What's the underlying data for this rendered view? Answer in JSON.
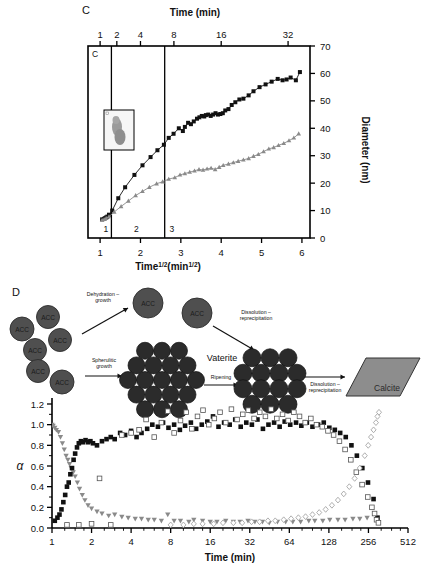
{
  "figure": {
    "panels": [
      {
        "letter": "C"
      },
      {
        "letter": "D"
      }
    ]
  },
  "panelC": {
    "letter": "C",
    "inner_letter": "C",
    "top_axis_title": "Time (min)",
    "top_tick_labels": [
      "1",
      "2",
      "4",
      "8",
      "16",
      "32"
    ],
    "bottom_axis_title_main": "Time",
    "bottom_axis_title_sup1": "1/2",
    "bottom_axis_title_mid": "(min",
    "bottom_axis_title_sup2": "1/2",
    "bottom_axis_title_end": ")",
    "bottom_tick_labels": [
      "1",
      "2",
      "3",
      "4",
      "5",
      "6"
    ],
    "y_axis_title": "Diameter (nm)",
    "y_tick_labels": [
      "0",
      "10",
      "20",
      "30",
      "40",
      "50",
      "60",
      "70"
    ],
    "region_labels": [
      "1",
      "2",
      "3"
    ],
    "inset_name": "tem-particle-inset"
  },
  "panelD": {
    "letter": "D",
    "schematic": {
      "acc_label": "ACC",
      "acc_count": 8,
      "arrow_labels": [
        {
          "line1": "Dehydration –",
          "line2": "growth"
        },
        {
          "line1": "Spherulitic",
          "line2": "growth"
        },
        {
          "line1": "Dissolution –",
          "line2": "reprecipitation"
        },
        {
          "line1": "Ripening",
          "line2": ""
        },
        {
          "line1": "Dissolution –",
          "line2": "reprecipitation"
        }
      ],
      "vaterite_label": "Vaterite",
      "calcite_label": "Calcite"
    },
    "y_axis_title": "α",
    "y_tick_labels": [
      "0.0",
      "0.2",
      "0.4",
      "0.6",
      "0.8",
      "1.0",
      "1.2"
    ],
    "x_axis_title": "Time (min)",
    "x_tick_labels": [
      "1",
      "2",
      "4",
      "8",
      "16",
      "32",
      "64",
      "128",
      "256",
      "512"
    ]
  },
  "colors": {
    "black": "#111111",
    "gray_marker": "#8a8a8a",
    "gray_dark": "#4a4a4a",
    "acc_fill": "#4f4f4f",
    "sphere_fill": "#2b2b2b",
    "calcite_fill": "#8d8d8d",
    "axis": "#000000"
  },
  "chart_data": [
    {
      "type": "scatter",
      "panel": "C",
      "title": "",
      "xlabel": "Time^1/2 (min^1/2)",
      "ylabel": "Diameter (nm)",
      "xlim": [
        0.7,
        6.2
      ],
      "ylim": [
        0,
        70
      ],
      "xticks": [
        1,
        2,
        3,
        4,
        5,
        6
      ],
      "yticks": [
        0,
        10,
        20,
        30,
        40,
        50,
        60,
        70
      ],
      "top_axis": {
        "label": "Time (min)",
        "ticks": [
          1,
          2,
          4,
          8,
          16,
          32
        ]
      },
      "region_dividers_x": [
        1.28,
        2.6
      ],
      "regions": [
        "1",
        "2",
        "3"
      ],
      "grid": false,
      "legend": "none",
      "series": [
        {
          "name": "black-squares-diameter",
          "marker": "filled-square",
          "color": "#111111",
          "x": [
            1.05,
            1.1,
            1.12,
            1.15,
            1.18,
            1.22,
            1.3,
            1.45,
            1.62,
            1.85,
            2.05,
            2.25,
            2.42,
            2.58,
            2.7,
            2.82,
            2.95,
            3.05,
            3.1,
            3.18,
            3.25,
            3.32,
            3.4,
            3.46,
            3.52,
            3.58,
            3.62,
            3.68,
            3.74,
            3.8,
            3.86,
            3.92,
            3.98,
            4.04,
            4.1,
            4.18,
            4.26,
            4.35,
            4.45,
            4.55,
            4.68,
            4.8,
            4.95,
            5.1,
            5.25,
            5.4,
            5.52,
            5.62,
            5.72,
            5.85,
            5.95
          ],
          "y": [
            6.8,
            7.0,
            7.2,
            7.5,
            7.8,
            8.5,
            10.0,
            14.5,
            18.5,
            23.0,
            26.5,
            29.5,
            32.0,
            34.0,
            36.5,
            38.0,
            40.0,
            39.0,
            40.5,
            42.0,
            41.5,
            42.5,
            43.5,
            44.0,
            44.5,
            44.3,
            44.8,
            45.0,
            44.5,
            45.0,
            45.5,
            45.0,
            45.2,
            45.5,
            46.5,
            47.0,
            48.5,
            49.5,
            50.5,
            50.8,
            52.0,
            53.5,
            55.0,
            56.0,
            57.0,
            58.0,
            57.5,
            57.8,
            58.5,
            57.5,
            60.5
          ]
        },
        {
          "name": "gray-triangles-diameter",
          "marker": "filled-triangle-up",
          "color": "#8a8a8a",
          "x": [
            1.05,
            1.1,
            1.15,
            1.22,
            1.35,
            1.52,
            1.7,
            1.88,
            2.05,
            2.22,
            2.4,
            2.55,
            2.7,
            2.85,
            2.98,
            3.1,
            3.22,
            3.34,
            3.45,
            3.55,
            3.65,
            3.75,
            3.85,
            3.95,
            4.05,
            4.18,
            4.3,
            4.42,
            4.55,
            4.68,
            4.8,
            4.92,
            5.05,
            5.18,
            5.3,
            5.42,
            5.55,
            5.68,
            5.8,
            5.92
          ],
          "y": [
            6.5,
            6.8,
            7.2,
            7.8,
            9.5,
            11.5,
            13.5,
            15.5,
            17.0,
            18.5,
            19.8,
            20.5,
            21.5,
            22.0,
            23.0,
            23.5,
            24.0,
            24.5,
            25.0,
            24.8,
            25.2,
            25.5,
            25.0,
            25.8,
            26.5,
            27.0,
            27.5,
            28.0,
            28.5,
            29.0,
            29.8,
            30.5,
            31.5,
            32.5,
            33.0,
            33.8,
            34.5,
            35.5,
            36.5,
            38.0
          ]
        }
      ]
    },
    {
      "type": "scatter",
      "panel": "D",
      "title": "",
      "xlabel": "Time (min)",
      "ylabel": "α",
      "xscale": "log2",
      "xlim": [
        1,
        512
      ],
      "ylim": [
        0.0,
        1.2
      ],
      "xticks": [
        1,
        2,
        4,
        8,
        16,
        32,
        64,
        128,
        256,
        512
      ],
      "yticks": [
        0.0,
        0.2,
        0.4,
        0.6,
        0.8,
        1.0,
        1.2
      ],
      "grid": false,
      "legend": "none",
      "series": [
        {
          "name": "acc-gray-down-triangles",
          "marker": "filled-triangle-down",
          "color": "#8a8a8a",
          "x": [
            1.0,
            1.02,
            1.05,
            1.08,
            1.12,
            1.16,
            1.2,
            1.24,
            1.28,
            1.32,
            1.36,
            1.4,
            1.45,
            1.5,
            1.56,
            1.62,
            1.7,
            1.78,
            1.88,
            2.0,
            2.2,
            2.4,
            2.7,
            3.0,
            3.4,
            3.8,
            4.3,
            4.8,
            5.4,
            6.0,
            6.8,
            7.6,
            8.5,
            9.5,
            11,
            12,
            14,
            16,
            18,
            21,
            24,
            27,
            31,
            35,
            40,
            45,
            52,
            60,
            68,
            78,
            90,
            100,
            115,
            130,
            150,
            170,
            195,
            220,
            250
          ],
          "y": [
            1.0,
            0.99,
            0.97,
            0.95,
            0.93,
            0.88,
            0.82,
            0.76,
            0.7,
            0.66,
            0.62,
            0.58,
            0.54,
            0.5,
            0.44,
            0.38,
            0.32,
            0.27,
            0.22,
            0.19,
            0.16,
            0.14,
            0.12,
            0.13,
            0.11,
            0.1,
            0.09,
            0.09,
            0.08,
            0.08,
            0.07,
            0.13,
            0.07,
            0.07,
            0.06,
            0.08,
            0.07,
            0.06,
            0.06,
            0.07,
            0.06,
            0.06,
            0.07,
            0.06,
            0.06,
            0.05,
            0.06,
            0.06,
            0.06,
            0.06,
            0.07,
            0.07,
            0.07,
            0.08,
            0.08,
            0.08,
            0.09,
            0.09,
            0.1
          ]
        },
        {
          "name": "vaterite-filled-squares",
          "marker": "filled-square",
          "color": "#111111",
          "x": [
            1.05,
            1.1,
            1.14,
            1.18,
            1.22,
            1.26,
            1.3,
            1.34,
            1.38,
            1.42,
            1.46,
            1.5,
            1.55,
            1.6,
            1.66,
            1.72,
            1.8,
            1.88,
            1.96,
            2.05,
            2.2,
            2.4,
            2.6,
            2.8,
            3.0,
            3.3,
            3.6,
            4.0,
            4.4,
            4.8,
            5.3,
            5.8,
            6.4,
            7.0,
            7.7,
            8.5,
            9.4,
            10.3,
            11.4,
            12.5,
            13.8,
            15.2,
            16.8,
            18.5,
            20.4,
            22.5,
            24.8,
            27.3,
            30.1,
            33.2,
            36.6,
            40.3,
            44.4,
            49,
            54,
            59,
            65,
            72,
            79,
            87,
            96,
            106,
            117,
            129,
            142,
            156,
            172,
            190,
            209,
            230,
            254,
            280,
            300
          ],
          "y": [
            0.07,
            0.1,
            0.13,
            0.18,
            0.25,
            0.32,
            0.4,
            0.44,
            0.52,
            0.58,
            0.66,
            0.72,
            0.78,
            0.82,
            0.84,
            0.83,
            0.85,
            0.83,
            0.84,
            0.82,
            0.8,
            0.84,
            0.86,
            0.88,
            0.86,
            0.92,
            0.9,
            0.94,
            0.88,
            0.92,
            0.96,
            1.0,
            0.98,
            1.02,
            0.97,
            1.0,
            0.95,
            0.99,
            1.02,
            0.96,
            1.0,
            1.03,
            1.08,
            0.98,
            1.02,
            1.0,
            1.05,
            0.98,
            1.02,
            1.0,
            1.05,
            0.96,
            1.0,
            1.02,
            0.98,
            1.03,
            1.0,
            1.02,
            0.99,
            1.02,
            0.98,
            1.0,
            1.02,
            0.97,
            0.95,
            0.92,
            0.88,
            0.8,
            0.7,
            0.58,
            0.44,
            0.28,
            0.1
          ]
        },
        {
          "name": "vaterite-open-squares",
          "marker": "open-square",
          "color": "#555555",
          "x": [
            1.3,
            1.6,
            2.0,
            2.3,
            2.8,
            3.4,
            4.0,
            4.6,
            5.2,
            6.0,
            6.8,
            7.6,
            8.5,
            9.5,
            10.5,
            11.6,
            12.8,
            14.1,
            15.6,
            17.2,
            19.0,
            21.0,
            23.2,
            25.6,
            28.3,
            31.2,
            34.5,
            38.1,
            42.1,
            46.5,
            51.4,
            56.8,
            62.7,
            69.3,
            76.5,
            84.5,
            93.3,
            103,
            114,
            126,
            139,
            154,
            170,
            188,
            207,
            229,
            253,
            272,
            285,
            295,
            305
          ],
          "y": [
            0.03,
            0.03,
            0.04,
            0.48,
            0.03,
            0.9,
            0.92,
            0.95,
            1.05,
            0.88,
            1.02,
            1.13,
            0.92,
            1.04,
            1.12,
            0.96,
            1.08,
            1.14,
            1.0,
            1.06,
            1.12,
            1.02,
            1.15,
            1.05,
            1.1,
            1.14,
            1.06,
            1.12,
            1.08,
            1.15,
            1.06,
            1.1,
            1.04,
            1.12,
            1.08,
            1.02,
            1.06,
            1.0,
            0.98,
            0.94,
            0.9,
            0.84,
            0.76,
            0.66,
            0.54,
            0.42,
            0.3,
            0.2,
            0.14,
            0.08,
            0.05
          ]
        },
        {
          "name": "calcite-open-diamonds",
          "marker": "open-diamond",
          "color": "#9a9a9a",
          "x": [
            8,
            10,
            12,
            14,
            17,
            20,
            24,
            28,
            33,
            38,
            44,
            50,
            58,
            66,
            75,
            85,
            96,
            108,
            121,
            135,
            150,
            166,
            183,
            201,
            220,
            240,
            255,
            268,
            280,
            292,
            300,
            308
          ],
          "y": [
            0.03,
            0.03,
            0.04,
            0.04,
            0.04,
            0.05,
            0.05,
            0.05,
            0.06,
            0.06,
            0.07,
            0.07,
            0.08,
            0.09,
            0.1,
            0.11,
            0.13,
            0.15,
            0.18,
            0.22,
            0.27,
            0.33,
            0.4,
            0.48,
            0.58,
            0.7,
            0.8,
            0.88,
            0.95,
            1.02,
            1.08,
            1.12
          ]
        }
      ]
    }
  ]
}
